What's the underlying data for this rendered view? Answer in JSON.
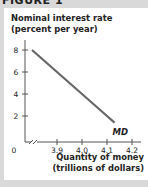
{
  "figure_label": "FIGURE 1",
  "chart_data": {
    "type": "line",
    "title": "",
    "ylabel_lines": [
      "Nominal interest rate",
      "(percent per year)"
    ],
    "xlabel_lines": [
      "Quantity of money",
      "(trillions of dollars)"
    ],
    "yticks": [
      2,
      4,
      6,
      8
    ],
    "ytick_labels": [
      "2",
      "4",
      "6",
      "8"
    ],
    "xticks": [
      3.9,
      4.0,
      4.1,
      4.2
    ],
    "xtick_labels": [
      "3.9",
      "4.0",
      "4.1",
      "4.2"
    ],
    "origin_label": "0",
    "x_axis_break": true,
    "ylim": [
      0,
      9
    ],
    "xlim": [
      3.75,
      4.22
    ],
    "grid": false,
    "series": [
      {
        "name": "MD",
        "label": "MD",
        "color": "#666666",
        "x": [
          3.8,
          3.9,
          4.0,
          4.1,
          4.13
        ],
        "y": [
          8,
          6,
          4,
          2,
          1.4
        ]
      }
    ]
  }
}
